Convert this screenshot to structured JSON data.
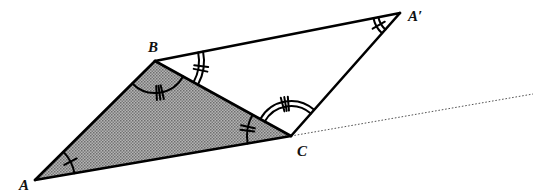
{
  "figure": {
    "shaded_triangle": [
      "A",
      "B",
      "C"
    ],
    "second_triangle": [
      "B",
      "A'",
      "C"
    ],
    "colors": {
      "stroke": "#000000",
      "shade": "#9a9a9a",
      "ray": "#555555",
      "background": "#ffffff"
    },
    "points": [
      {
        "id": "A",
        "label": "A"
      },
      {
        "id": "B",
        "label": "B"
      },
      {
        "id": "C",
        "label": "C"
      },
      {
        "id": "Ap",
        "label": "A′"
      }
    ],
    "segments": [
      {
        "from": "A",
        "to": "B"
      },
      {
        "from": "B",
        "to": "C"
      },
      {
        "from": "A",
        "to": "C"
      },
      {
        "from": "B",
        "to": "Ap"
      },
      {
        "from": "Ap",
        "to": "C"
      }
    ],
    "ray": {
      "from": "C",
      "style": "dotted",
      "direction": "extension beyond C"
    },
    "angle_marks": [
      {
        "vertex": "A",
        "between": [
          "B",
          "C"
        ],
        "arcs": 1,
        "ticks": 1
      },
      {
        "vertex": "Ap",
        "between": [
          "B",
          "C"
        ],
        "arcs": 2,
        "ticks": 1
      },
      {
        "vertex": "B",
        "between": [
          "A",
          "C"
        ],
        "arcs": 1,
        "ticks": 3
      },
      {
        "vertex": "B",
        "between": [
          "Ap",
          "C"
        ],
        "arcs": 2,
        "ticks": 2
      },
      {
        "vertex": "C",
        "between": [
          "A",
          "B"
        ],
        "arcs": 1,
        "ticks": 2
      },
      {
        "vertex": "C",
        "between": [
          "B",
          "Ap"
        ],
        "arcs": 2,
        "ticks": 3
      }
    ]
  }
}
